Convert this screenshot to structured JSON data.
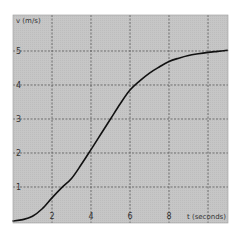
{
  "chart_data": {
    "type": "line",
    "title": "",
    "xlabel": "t (seconds)",
    "ylabel": "v (m/s)",
    "xlim": [
      0,
      11
    ],
    "ylim": [
      0,
      6.05
    ],
    "x_ticks": [
      2,
      4,
      6,
      8
    ],
    "x_gridlines": [
      2,
      4,
      6,
      8,
      10
    ],
    "y_ticks": [
      1,
      2,
      3,
      4,
      5
    ],
    "grid": true,
    "grid_style": "dashed",
    "legend": null,
    "series": [
      {
        "name": "velocity",
        "x": [
          0,
          0.5,
          1,
          1.5,
          2,
          2.5,
          3,
          3.5,
          4,
          4.5,
          5,
          5.5,
          6,
          6.5,
          7,
          7.5,
          8,
          8.5,
          9,
          9.5,
          10,
          10.5,
          11
        ],
        "values": [
          0,
          0.04,
          0.14,
          0.36,
          0.68,
          0.98,
          1.25,
          1.66,
          2.1,
          2.55,
          3.0,
          3.45,
          3.85,
          4.12,
          4.35,
          4.53,
          4.69,
          4.79,
          4.87,
          4.92,
          4.96,
          4.99,
          5.02
        ]
      }
    ]
  },
  "colors": {
    "plot_background": "#c6c6c6",
    "grid": "#555555",
    "line": "#111111",
    "page_background": "#ffffff",
    "text": "#333333"
  }
}
